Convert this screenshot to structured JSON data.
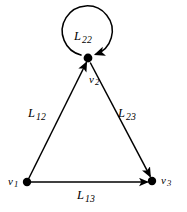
{
  "figure": {
    "kind": "directed-graph",
    "background_color": "#ffffff",
    "stroke_color": "#000000",
    "text_color": "#000000"
  },
  "vertices": [
    {
      "id": "v1",
      "label": "v",
      "sub": "1",
      "x": 27,
      "y": 182,
      "radius": 4.2
    },
    {
      "id": "v2",
      "label": "v",
      "sub": "2",
      "x": 88,
      "y": 58,
      "radius": 4.2
    },
    {
      "id": "v3",
      "label": "v",
      "sub": "3",
      "x": 152,
      "y": 181,
      "radius": 4.2
    }
  ],
  "edges": [
    {
      "id": "L12",
      "label": "L",
      "sub": "12",
      "from": "v1",
      "to": "v2",
      "arrow_at": "v2"
    },
    {
      "id": "L23",
      "label": "L",
      "sub": "23",
      "from": "v2",
      "to": "v3",
      "arrow_at": "v3"
    },
    {
      "id": "L13",
      "label": "L",
      "sub": "13",
      "from": "v1",
      "to": "v3",
      "arrow_at": "v3"
    }
  ],
  "self_loops": [
    {
      "id": "L22",
      "label": "L",
      "sub": "22",
      "at": "v2",
      "center_x": 91,
      "center_y": 37,
      "radius": 25,
      "arrow_at": "v2"
    }
  ]
}
